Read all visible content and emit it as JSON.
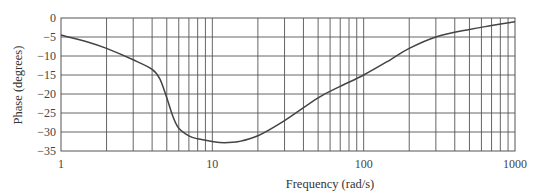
{
  "chart_data": {
    "type": "line",
    "title": "",
    "xlabel": "Frequency (rad/s)",
    "ylabel": "Phase (degrees)",
    "xscale": "log",
    "xlim": [
      1,
      1000
    ],
    "ylim": [
      -35,
      0
    ],
    "grid": true,
    "legend": null,
    "x_tick_labels": [
      "1",
      "10",
      "100",
      "1000"
    ],
    "y_tick_labels": [
      "0",
      "-5",
      "-10",
      "-15",
      "-20",
      "-25",
      "-30",
      "-35"
    ],
    "y_ticks": [
      0,
      -5,
      -10,
      -15,
      -20,
      -25,
      -30,
      -35
    ],
    "series": [
      {
        "name": "Phase",
        "color": "#444444",
        "x": [
          1,
          1.5,
          2,
          3,
          4,
          4.5,
          5,
          5.5,
          6,
          7,
          8,
          10,
          12,
          15,
          20,
          30,
          50,
          70,
          100,
          150,
          200,
          300,
          500,
          700,
          1000
        ],
        "values": [
          -4.5,
          -6.3,
          -8,
          -11,
          -13.5,
          -16,
          -21,
          -26,
          -29,
          -31,
          -31.8,
          -32.5,
          -32.8,
          -32.5,
          -31,
          -27,
          -21,
          -18,
          -15,
          -11,
          -8,
          -5,
          -3,
          -2,
          -1
        ]
      }
    ]
  },
  "labels": {
    "xlabel": "Frequency (rad/s)",
    "ylabel": "Phase (degrees)"
  }
}
